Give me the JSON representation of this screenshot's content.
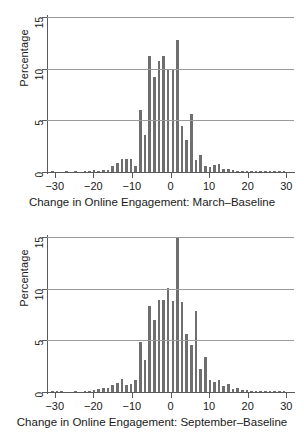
{
  "chart_data": [
    {
      "type": "bar",
      "title": "",
      "xlabel": "Change in Online Engagement: March–Baseline",
      "ylabel": "Percentage",
      "xlim": [
        -32,
        32
      ],
      "ylim": [
        0,
        15
      ],
      "xticks": [
        -30,
        -20,
        -10,
        0,
        10,
        20,
        30
      ],
      "xtick_labels": [
        "−30",
        "−20",
        "−10",
        "0",
        "10",
        "20",
        "30"
      ],
      "yticks": [
        0,
        5,
        10,
        15
      ],
      "ytick_labels": [
        "0",
        "5",
        "10",
        "15"
      ],
      "grid": "horizontal",
      "legend": "none",
      "bin_width": 1.2,
      "categories": [
        -30.6,
        -29.4,
        -28.2,
        -27.0,
        -25.8,
        -24.6,
        -23.4,
        -22.2,
        -21.0,
        -19.8,
        -18.6,
        -17.4,
        -16.2,
        -15.0,
        -13.8,
        -12.6,
        -11.4,
        -10.2,
        -9.0,
        -7.8,
        -6.6,
        -5.4,
        -4.2,
        -3.0,
        -1.8,
        -0.6,
        0.6,
        1.8,
        3.0,
        4.2,
        5.4,
        6.6,
        7.8,
        9.0,
        10.2,
        11.4,
        12.6,
        13.8,
        15.0,
        16.2,
        17.4,
        18.6,
        19.8,
        21.0,
        22.2,
        23.4,
        24.6,
        25.8,
        27.0,
        28.2,
        29.4
      ],
      "values": [
        0.05,
        0.0,
        0.0,
        0.05,
        0.0,
        0.05,
        0.0,
        0.05,
        0.1,
        0.15,
        0.1,
        0.2,
        0.2,
        0.55,
        0.9,
        1.25,
        1.25,
        1.3,
        0.55,
        6.0,
        3.6,
        11.2,
        9.2,
        10.75,
        11.25,
        9.95,
        9.95,
        12.75,
        4.5,
        3.1,
        5.6,
        1.15,
        1.6,
        0.6,
        0.5,
        0.65,
        0.75,
        0.3,
        0.25,
        0.2,
        0.12,
        0.1,
        0.08,
        0.06,
        0.05,
        0.05,
        0.05,
        0.05,
        0.04,
        0.03,
        0.02
      ]
    },
    {
      "type": "bar",
      "title": "",
      "xlabel": "Change in Online Engagement: September–Baseline",
      "ylabel": "Percentage",
      "xlim": [
        -32,
        32
      ],
      "ylim": [
        0,
        15
      ],
      "xticks": [
        -30,
        -20,
        -10,
        0,
        10,
        20,
        30
      ],
      "xtick_labels": [
        "−30",
        "−20",
        "−10",
        "0",
        "10",
        "20",
        "30"
      ],
      "yticks": [
        0,
        5,
        10,
        15
      ],
      "ytick_labels": [
        "0",
        "5",
        "10",
        "15"
      ],
      "grid": "horizontal",
      "legend": "none",
      "bin_width": 1.2,
      "categories": [
        -30.6,
        -29.4,
        -28.2,
        -27.0,
        -25.8,
        -24.6,
        -23.4,
        -22.2,
        -21.0,
        -19.8,
        -18.6,
        -17.4,
        -16.2,
        -15.0,
        -13.8,
        -12.6,
        -11.4,
        -10.2,
        -9.0,
        -7.8,
        -6.6,
        -5.4,
        -4.2,
        -3.0,
        -1.8,
        -0.6,
        0.6,
        1.8,
        3.0,
        4.2,
        5.4,
        6.6,
        7.8,
        9.0,
        10.2,
        11.4,
        12.6,
        13.8,
        15.0,
        16.2,
        17.4,
        18.6,
        19.8,
        21.0,
        22.2,
        23.4,
        24.6,
        25.8,
        27.0,
        28.2,
        29.4
      ],
      "values": [
        0.05,
        0.1,
        0.05,
        0.0,
        0.0,
        0.05,
        0.0,
        0.05,
        0.1,
        0.2,
        0.25,
        0.35,
        0.35,
        0.65,
        0.85,
        1.3,
        0.7,
        0.75,
        1.2,
        4.8,
        3.1,
        8.35,
        6.95,
        8.9,
        8.95,
        10.1,
        8.8,
        15.0,
        8.7,
        5.65,
        4.55,
        7.85,
        2.2,
        3.4,
        1.15,
        1.0,
        1.2,
        0.55,
        0.75,
        0.25,
        0.4,
        0.2,
        0.15,
        0.1,
        0.08,
        0.06,
        0.05,
        0.05,
        0.05,
        0.04,
        0.03
      ]
    }
  ],
  "panels": [
    {
      "ylabel": "Percentage",
      "xtitle": "Change in Online Engagement: March–Baseline"
    },
    {
      "ylabel": "Percentage",
      "xtitle": "Change in Online Engagement: September–Baseline"
    }
  ],
  "style": {
    "bar_color": "#6e6e6e",
    "grid_color": "#9a9a9a",
    "axis_color": "#5a5a5a",
    "background": "#ffffff",
    "text_color": "#1a1a1a"
  }
}
